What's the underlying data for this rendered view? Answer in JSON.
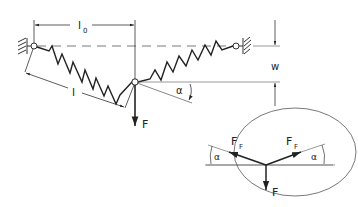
{
  "diagram": {
    "labels": {
      "l0": "l",
      "l0_sub": "0",
      "l": "l",
      "w": "w",
      "alpha_main": "α",
      "F_main": "F",
      "FF_left": "F",
      "FF_left_sub": "F",
      "FF_right": "F",
      "FF_right_sub": "F",
      "alpha_left": "α",
      "alpha_right": "α",
      "F_free": "F"
    },
    "colors": {
      "stroke": "#222222",
      "thin": "#555555",
      "background": "#ffffff"
    }
  }
}
